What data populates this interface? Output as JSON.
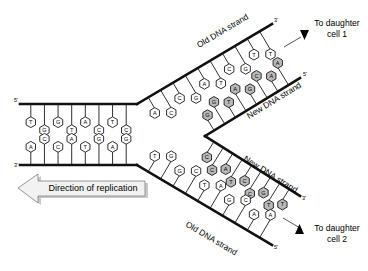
{
  "figure": {
    "width": 368,
    "height": 271,
    "background": "#ffffff",
    "old_base_fill": "#ffffff",
    "new_base_fill": "#b9b9b9",
    "line_color": "#111111"
  },
  "labels": {
    "old_strand_top": "Old DNA strand",
    "new_strand_top": "New DNA strand",
    "new_strand_bottom": "New DNA strand",
    "old_strand_bottom": "Old DNA strand",
    "direction_of_replication": "Direction of replication",
    "to_daughter_cell_1_line1": "To daughter",
    "to_daughter_cell_1_line2": "cell 1",
    "to_daughter_cell_2_line1": "To daughter",
    "to_daughter_cell_2_line2": "cell 2"
  },
  "end_labels": {
    "parent_top_left": "5'",
    "parent_bottom_left": "3'",
    "old_top_right": "3'",
    "new_top_right": "5'",
    "new_bottom_right": "3'",
    "old_bottom_right": "5'"
  },
  "strands": {
    "parent_top": {
      "name": "parent-top-strand",
      "type": "old",
      "end_label_left": "5'",
      "bases": [
        "T",
        "G",
        "G",
        "T",
        "A",
        "C",
        "T",
        "C"
      ]
    },
    "parent_bottom": {
      "name": "parent-bottom-strand",
      "type": "old",
      "end_label_left": "3'",
      "bases": [
        "A",
        "C",
        "C",
        "A",
        "T",
        "G",
        "A",
        "G"
      ]
    },
    "old_top": {
      "name": "old-top-branch",
      "type": "old",
      "end_label_right": "3'",
      "bases": [
        "A",
        "C",
        "C",
        "G",
        "A",
        "T",
        "C",
        "G",
        "T",
        "T"
      ]
    },
    "new_top": {
      "name": "new-top-branch",
      "type": "new",
      "end_label_right": "5'",
      "bases": [
        "G",
        "G",
        "T",
        "A",
        "G",
        "C",
        "A",
        "A"
      ]
    },
    "new_bottom": {
      "name": "new-bottom-branch",
      "type": "new",
      "end_label_right": "3'",
      "bases": [
        "C",
        "C",
        "A",
        "T",
        "C",
        "C",
        "G",
        "T",
        "T"
      ]
    },
    "old_bottom": {
      "name": "old-bottom-branch",
      "type": "old",
      "end_label_right": "5'",
      "bases": [
        "T",
        "G",
        "G",
        "C",
        "T",
        "A",
        "G",
        "C",
        "A",
        "A"
      ]
    }
  }
}
